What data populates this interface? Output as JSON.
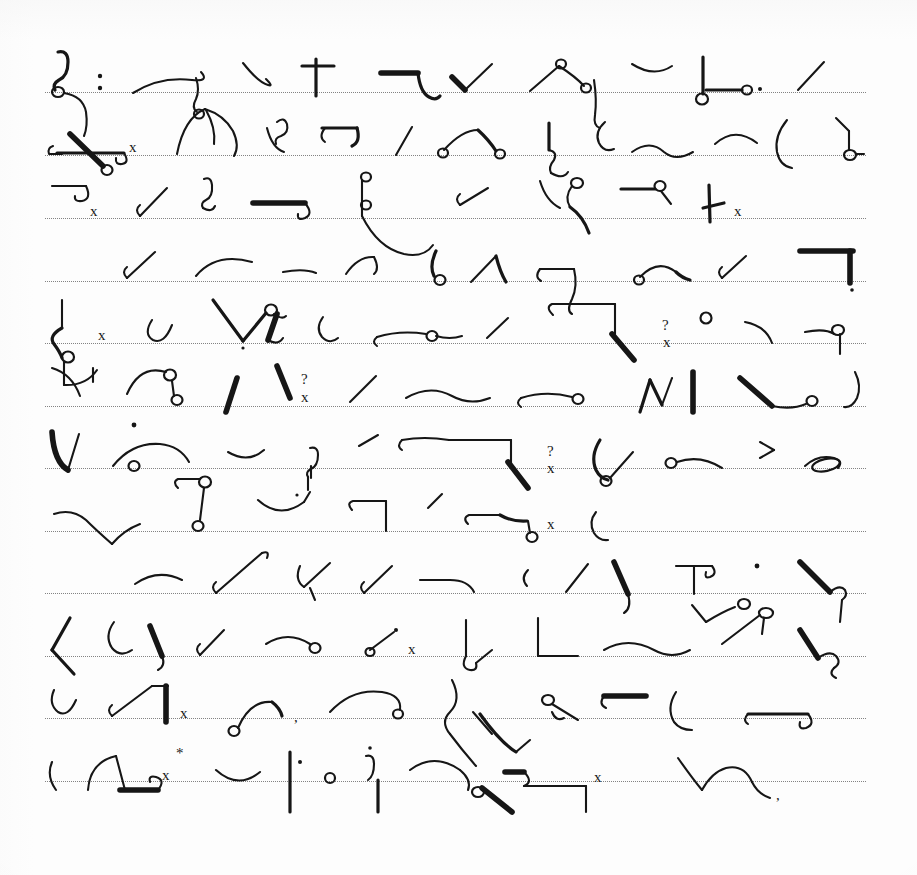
{
  "document": {
    "kind": "handwritten-shorthand-manuscript",
    "script_system": "Gregg shorthand",
    "page_title": "Shorthand Manuscript Page",
    "paper": {
      "background_color": "#fdfdfd",
      "ink_color": "#161616",
      "rule_color": "#6e6e6e",
      "rule_style": "dotted",
      "rule_count": 12,
      "first_rule_y": 92,
      "rule_spacing": 62.7,
      "rule_left_x": 45,
      "rule_right_x": 866,
      "width": 917,
      "height": 875
    },
    "annotations": {
      "x_marks": "x",
      "question_marks": "?",
      "asterisk": "*",
      "period": ".",
      "comma": ",",
      "colon": ":",
      "angle": ">",
      "tick": "|"
    },
    "lines": [
      {
        "index": 1,
        "baseline_y": 92,
        "outlines": [
          "hook-stem-with-loop",
          "colon-dot",
          "long-shallow-curve-with-tail",
          "small-down-hook",
          "plus-cross",
          "right-angle-with-descender",
          "short-thick-check",
          "peak-with-loops-and-stem",
          "shallow-arc",
          "vertical-stem-with-circle-and-dot",
          "forward-slash"
        ]
      },
      {
        "index": 2,
        "baseline_y": 155,
        "outlines": [
          "long-horizontal-with-crossing-stroke-and-loop",
          "x-mark",
          "steep-rising-stroke-with-curl",
          "curved-hook-pair",
          "small-s-curve",
          "bracket-hook",
          "short-slash",
          "arc-with-loop-terminal",
          "vertical-with-hook-descender",
          "small-c-hook",
          "wavy-line",
          "shallow-smile-curve",
          "tall-paren-curve",
          "right-angle-with-circle"
        ]
      },
      {
        "index": 3,
        "baseline_y": 218,
        "outlines": [
          "small-flat-hook",
          "x-mark",
          "check-stroke",
          "vertical-hook-q",
          "thick-horizontal-with-tail",
          "vertical-with-two-loops",
          "small-rising-slash",
          "curve-with-loop-and-tail",
          "horizontal-with-circle-terminal",
          "vertical-stroke-with-foot",
          "x-mark"
        ]
      },
      {
        "index": 4,
        "baseline_y": 281,
        "outlines": [
          "check-stroke",
          "broad-arc",
          "small-dash",
          "angled-stroke-with-hook",
          "loop-on-stem",
          "rising-stroke-with-curve",
          "horizontal-bracket",
          "arch-with-circle-ends",
          "short-slash",
          "right-angle-thick"
        ]
      },
      {
        "index": 5,
        "baseline_y": 343,
        "outlines": [
          "long-vertical-with-s-curve-and-circle",
          "x-mark",
          "u-hook",
          "v-shape-with-loop-and-stem",
          "small-c-hook",
          "flat-arc-with-circle",
          "short-slash",
          "z-bracket-with-vertical",
          "question-mark",
          "x-mark",
          "small-circle",
          "paren-curve",
          "horizontal-with-circle-and-tail"
        ]
      },
      {
        "index": 6,
        "baseline_y": 406,
        "outlines": [
          "curved-descender",
          "tick",
          "arch-with-two-circles",
          "thick-diagonal",
          "thick-slash",
          "question-mark",
          "x-mark",
          "forward-slash",
          "wave-curve",
          "flat-hook-with-circle",
          "zigzag-with-verticals",
          "thick-diagonal",
          "long-curve-with-circle"
        ]
      },
      {
        "index": 7,
        "baseline_y": 468,
        "outlines": [
          "thick-u-check",
          "dot",
          "arc-with-circle-terminal",
          "small-smile-curve",
          "p-loop-stem",
          "small-slash",
          "bracket-with-thick-diagonal",
          "question-mark",
          "x-mark",
          "paren-with-circle-and-slash",
          "circle-with-arc",
          "greater-than-mark",
          "oval-loop-on-line"
        ]
      },
      {
        "index": 8,
        "baseline_y": 531,
        "outlines": [
          "wave-with-hook",
          "flat-loop-with-descender-circle",
          "smile-curve-with-rising-tail",
          "vertical-tick",
          "right-angle-bracket",
          "small-slash",
          "flat-hook-with-arch-and-loop",
          "x-mark",
          "small-c-hook"
        ]
      },
      {
        "index": 9,
        "baseline_y": 593,
        "outlines": [
          "shallow-arc",
          "long-rising-stroke-with-hook",
          "check-with-v-tail",
          "check-stroke",
          "dash-with-arch",
          "small-c-angle",
          "forward-slash",
          "thick-check",
          "t-shape-with-loop",
          "v-with-loop",
          "dot",
          "thick-diagonal-with-hook"
        ]
      },
      {
        "index": 10,
        "baseline_y": 656,
        "outlines": [
          "angle-bracket-left",
          "curl-with-thick-stroke",
          "rising-slash",
          "arc-with-loop",
          "small-loop-with-dot",
          "x-mark",
          "vertical-with-hook-and-slash",
          "l-bracket",
          "wave-curve",
          "angled-line-with-loop",
          "thick-v-with-curl"
        ]
      },
      {
        "index": 11,
        "baseline_y": 718,
        "outlines": [
          "u-hook",
          "long-slope-with-vertical",
          "x-mark",
          "small-curve-with-circle",
          "comma",
          "wave-with-loop-terminal",
          "s-curve-with-loop",
          "thick-angular-hook",
          "small-loop-with-tail",
          "flat-thick-dash",
          "paren-curve",
          "flat-hook-dash"
        ]
      },
      {
        "index": 12,
        "baseline_y": 781,
        "outlines": [
          "small-paren",
          "arch-with-thick-foot",
          "x-mark",
          "asterisk",
          "smile-curve",
          "vertical-bar-with-dot",
          "small-circle",
          "q-with-dot-and-bar",
          "arch-curve",
          "loop-with-thick-diagonal",
          "thick-hook",
          "right-angle-bracket",
          "x-mark",
          "arch-with-two-humps",
          "comma"
        ]
      }
    ]
  }
}
